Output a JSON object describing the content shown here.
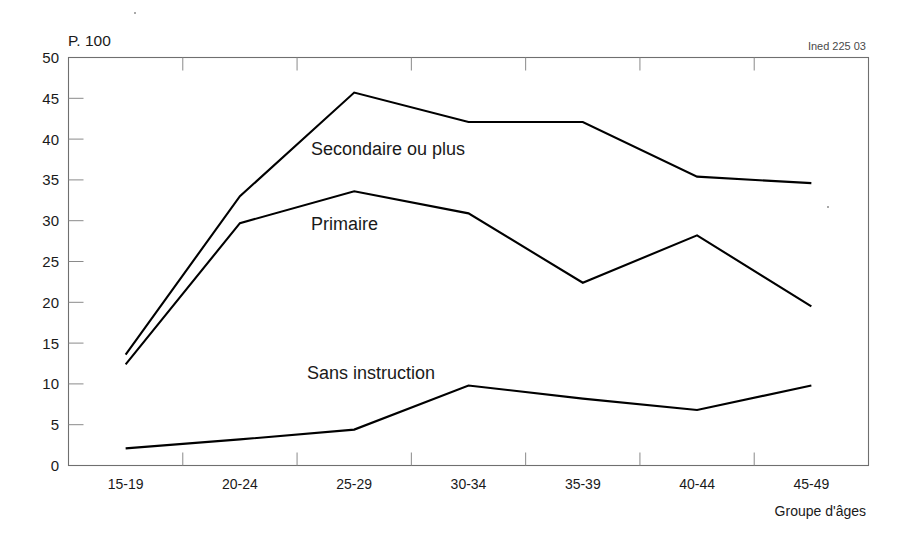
{
  "figure": {
    "credit": "Ined 225 03",
    "y_axis_note": "P. 100",
    "x_axis_caption": "Groupe d'âges"
  },
  "chart_data": {
    "type": "line",
    "title": "",
    "subtitle": "",
    "xlabel": "Groupe d'âges",
    "ylabel": "P. 100",
    "categories": [
      "15-19",
      "20-24",
      "25-29",
      "30-34",
      "35-39",
      "40-44",
      "45-49"
    ],
    "ylim": [
      0,
      50
    ],
    "yticks": [
      0,
      5,
      10,
      15,
      20,
      25,
      30,
      35,
      40,
      45,
      50
    ],
    "ytick_labels": [
      "0",
      "5",
      "10",
      "15",
      "20",
      "25",
      "30",
      "35",
      "40",
      "45",
      "50"
    ],
    "grid": false,
    "legend_position": "inline-annotations",
    "series": [
      {
        "name": "Secondaire ou plus",
        "values": [
          13.6,
          33.0,
          45.7,
          42.1,
          42.1,
          35.4,
          34.6
        ],
        "color": "#000000",
        "label_x": "25-29",
        "label_y": 38.0
      },
      {
        "name": "Primaire",
        "values": [
          12.4,
          29.7,
          33.6,
          30.9,
          22.4,
          28.2,
          19.5
        ],
        "color": "#000000",
        "label_x": "25-29",
        "label_y": 27.8
      },
      {
        "name": "Sans instruction",
        "values": [
          2.1,
          3.2,
          4.4,
          9.8,
          8.2,
          6.8,
          9.8
        ],
        "color": "#000000",
        "label_x": "25-29",
        "label_y": 13.2
      }
    ],
    "annotations": [
      {
        "text": "Secondaire ou plus",
        "x_px": 311,
        "y_px": 155
      },
      {
        "text": "Primaire",
        "x_px": 311,
        "y_px": 230
      },
      {
        "text": "Sans instruction",
        "x_px": 307,
        "y_px": 379
      }
    ]
  }
}
